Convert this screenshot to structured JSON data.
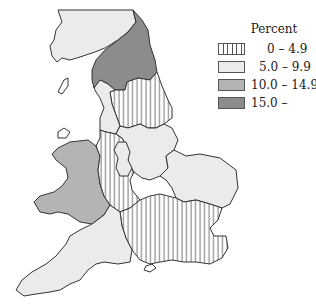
{
  "map": {
    "title": "",
    "subject": "England and Wales regions",
    "legend": {
      "title": "Percent",
      "items": [
        {
          "label": "0 – 4.9",
          "fill": "hatch",
          "color": "#555555"
        },
        {
          "label": "5.0 – 9.9",
          "fill": "solid",
          "color": "#ebebeb"
        },
        {
          "label": "10.0 – 14.9",
          "fill": "solid",
          "color": "#b4b4b4"
        },
        {
          "label": "15.0 –",
          "fill": "solid",
          "color": "#8c8c8c"
        }
      ]
    },
    "regions": [
      {
        "name": "Cumbria / North West upper",
        "class": "5.0 – 9.9"
      },
      {
        "name": "North East",
        "class": "15.0 –"
      },
      {
        "name": "Yorkshire",
        "class": "0 – 4.9"
      },
      {
        "name": "Lancashire / North West",
        "class": "5.0 – 9.9"
      },
      {
        "name": "Wales",
        "class": "10.0 – 14.9"
      },
      {
        "name": "West Midlands",
        "class": "0 – 4.9"
      },
      {
        "name": "East Midlands",
        "class": "5.0 – 9.9"
      },
      {
        "name": "East Anglia",
        "class": "5.0 – 9.9"
      },
      {
        "name": "South East",
        "class": "0 – 4.9"
      },
      {
        "name": "South West",
        "class": "5.0 – 9.9"
      }
    ]
  }
}
